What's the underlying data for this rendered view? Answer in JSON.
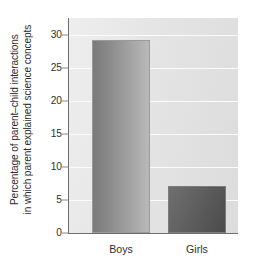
{
  "chart_data": {
    "type": "bar",
    "title": "",
    "xlabel": "",
    "ylabel_line1": "Percentage of parent–child interactions",
    "ylabel_line2": "in which parent explained science concepts",
    "categories": [
      "Boys",
      "Girls"
    ],
    "values": [
      29.2,
      7.1
    ],
    "series": [
      {
        "name": "Percentage of parent-child interactions in which parent explained science concepts",
        "values": [
          29.2,
          7.1
        ]
      }
    ],
    "ylim": [
      0,
      32.5
    ],
    "yticks": [
      0,
      5,
      10,
      15,
      20,
      25,
      30
    ],
    "ytick_labels": [
      "0",
      "5",
      "10",
      "15",
      "20",
      "25",
      "30"
    ],
    "grid": "horizontal",
    "legend": "none",
    "bar_colors": [
      "#9a9a9a",
      "#5a5a5a"
    ],
    "plot_background": "#e4e4e4",
    "gridline_color": "#fbfbfb",
    "axis_color": "#6e6e6e"
  }
}
